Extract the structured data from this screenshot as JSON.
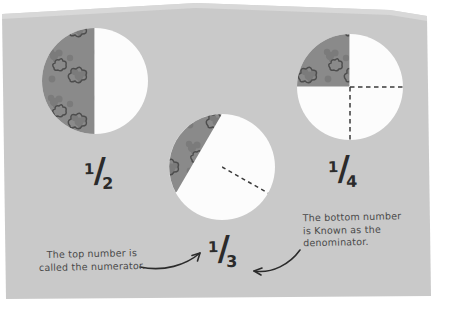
{
  "page": {
    "background_color": "#c9c9c9",
    "outside_color": "#ffffff",
    "fill_color": "#8a8a8a",
    "empty_color": "#fcfcfc",
    "line_color": "#3a3a3a",
    "text_color": "#4a4a4a"
  },
  "diagram": {
    "type": "fraction-circles",
    "title": "",
    "circles": [
      {
        "id": "half",
        "label": "1/2",
        "numerator": "1",
        "slash": "/",
        "denominator": "2",
        "shaded_parts": 1,
        "total_parts": 2,
        "shaded_degrees": 180,
        "divider_style": [
          "solid"
        ],
        "center": [
          95,
          81
        ],
        "radius": 53
      },
      {
        "id": "third",
        "label": "1/3",
        "numerator": "1",
        "slash": "/",
        "denominator": "3",
        "shaded_parts": 1,
        "total_parts": 3,
        "shaded_degrees": 120,
        "divider_style": [
          "solid",
          "dashed",
          "dashed"
        ],
        "center": [
          222,
          167
        ],
        "radius": 53
      },
      {
        "id": "quarter",
        "label": "1/4",
        "numerator": "1",
        "slash": "/",
        "denominator": "4",
        "shaded_parts": 1,
        "total_parts": 4,
        "shaded_degrees": 90,
        "divider_style": [
          "solid",
          "solid",
          "dashed",
          "dashed"
        ],
        "center": [
          350,
          87
        ],
        "radius": 53
      }
    ]
  },
  "captions": {
    "numerator": "The top number is\ncalled the numerator.",
    "denominator": "The bottom number\nis Known as the\ndenominator."
  },
  "edge_text": {
    "fragment_line_1": "s",
    "fragment_line_2": "a"
  }
}
